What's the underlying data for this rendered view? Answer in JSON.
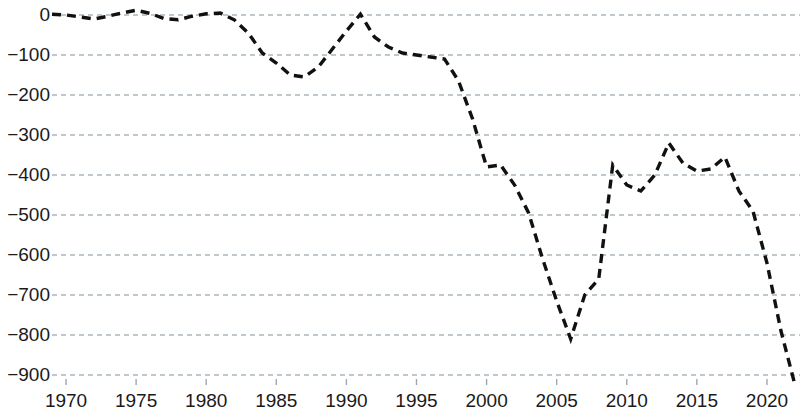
{
  "chart_data": {
    "type": "line",
    "title": "",
    "subtitle": "",
    "xlabel": "",
    "ylabel": "",
    "xlim": [
      1968.5,
      2022.5
    ],
    "ylim": [
      -930,
      25
    ],
    "grid": true,
    "grid_axis": "y",
    "legend": "none",
    "line_style": "dashed",
    "line_color": "#111111",
    "grid_color": "#a9b7c0",
    "y_ticks": [
      0,
      -100,
      -200,
      -300,
      -400,
      -500,
      -600,
      -700,
      -800,
      -900
    ],
    "y_tick_labels": [
      "0",
      "−100",
      "−200",
      "−300",
      "−400",
      "−500",
      "−600",
      "−700",
      "−800",
      "−900"
    ],
    "x_ticks": [
      1970,
      1975,
      1980,
      1985,
      1990,
      1995,
      2000,
      2005,
      2010,
      2015,
      2020
    ],
    "x_tick_labels": [
      "1970",
      "1975",
      "1980",
      "1985",
      "1990",
      "1995",
      "2000",
      "2005",
      "2010",
      "2015",
      "2020"
    ],
    "series": [
      {
        "name": "value",
        "x": [
          1969,
          1970,
          1971,
          1972,
          1973,
          1974,
          1975,
          1976,
          1977,
          1978,
          1979,
          1980,
          1981,
          1982,
          1983,
          1984,
          1985,
          1986,
          1987,
          1988,
          1989,
          1990,
          1991,
          1992,
          1993,
          1994,
          1995,
          1996,
          1997,
          1998,
          1999,
          2000,
          2001,
          2002,
          2003,
          2004,
          2005,
          2006,
          2007,
          2008,
          2009,
          2010,
          2011,
          2012,
          2013,
          2014,
          2015,
          2016,
          2017,
          2018,
          2019,
          2020,
          2021,
          2022
        ],
        "values": [
          2,
          0,
          -5,
          -10,
          -3,
          5,
          12,
          4,
          -9,
          -12,
          -3,
          3,
          5,
          -12,
          -45,
          -95,
          -120,
          -150,
          -155,
          -130,
          -85,
          -40,
          2,
          -55,
          -80,
          -95,
          -100,
          -105,
          -110,
          -165,
          -260,
          -380,
          -375,
          -425,
          -495,
          -610,
          -715,
          -810,
          -700,
          -660,
          -375,
          -425,
          -440,
          -400,
          -320,
          -370,
          -390,
          -385,
          -355,
          -440,
          -490,
          -620,
          -790,
          -925
        ],
        "marker": "none"
      }
    ]
  },
  "axes": {
    "y_axis_name": "value-axis",
    "x_axis_name": "year-axis"
  }
}
